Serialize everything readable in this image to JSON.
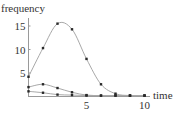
{
  "chart_data": {
    "type": "scatter",
    "title": "",
    "xlabel": "time",
    "ylabel": "frequency",
    "xlim": [
      0,
      10
    ],
    "ylim": [
      0,
      16.5
    ],
    "x_ticks": [
      5,
      10
    ],
    "y_ticks": [
      5,
      10,
      15
    ],
    "grid": false,
    "legend": null,
    "x": [
      0,
      1.25,
      2.5,
      3.75,
      5,
      6.25,
      7.5,
      8.75,
      10
    ],
    "series": [
      {
        "name": "series-1",
        "fit": "smooth curve",
        "values": [
          4.2,
          10.3,
          15.5,
          14.3,
          8.0,
          2.6,
          0.6,
          0.2,
          0.2
        ]
      },
      {
        "name": "series-2",
        "fit": "smooth curve",
        "values": [
          2.0,
          2.6,
          1.8,
          0.9,
          0.3,
          0.2,
          0.2,
          0.2,
          0.2
        ]
      },
      {
        "name": "series-3",
        "fit": "smooth curve",
        "values": [
          1.1,
          0.8,
          0.4,
          0.3,
          0.2,
          0.2,
          0.2,
          0.2,
          0.2
        ]
      }
    ]
  },
  "colors": {
    "axis": "#9a9a9a",
    "curve": "#a8a8a8",
    "dot": "#2a2a2a",
    "text": "#333333"
  }
}
